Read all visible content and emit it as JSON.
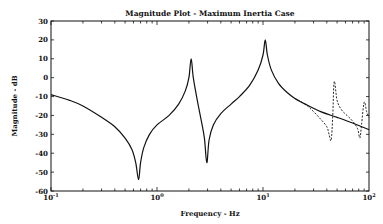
{
  "chart_data": {
    "type": "line",
    "title": "Magnitude Plot - Maximum Inertia Case",
    "xlabel": "Frequency - Hz",
    "ylabel": "Magnitude - dB",
    "xscale": "log",
    "xlim": [
      0.1,
      100
    ],
    "ylim": [
      -60,
      30
    ],
    "yticks": [
      30,
      20,
      10,
      0,
      -10,
      -20,
      -30,
      -40,
      -50,
      -60
    ],
    "xticks": [
      {
        "value": 0.1,
        "base": "10",
        "exp": "-1"
      },
      {
        "value": 1,
        "base": "10",
        "exp": "0"
      },
      {
        "value": 10,
        "base": "10",
        "exp": "1"
      },
      {
        "value": 100,
        "base": "10",
        "exp": "2"
      }
    ],
    "grid": false,
    "legend": null,
    "series": [
      {
        "name": "solid",
        "style": "solid",
        "points": [
          [
            0.1,
            -9
          ],
          [
            0.15,
            -12
          ],
          [
            0.2,
            -15
          ],
          [
            0.3,
            -21
          ],
          [
            0.4,
            -26
          ],
          [
            0.5,
            -32
          ],
          [
            0.58,
            -38
          ],
          [
            0.63,
            -45
          ],
          [
            0.67,
            -54
          ],
          [
            0.7,
            -45
          ],
          [
            0.75,
            -37
          ],
          [
            0.85,
            -30
          ],
          [
            1.0,
            -25
          ],
          [
            1.3,
            -20
          ],
          [
            1.6,
            -14
          ],
          [
            1.85,
            -7
          ],
          [
            2.0,
            0
          ],
          [
            2.1,
            10
          ],
          [
            2.2,
            0
          ],
          [
            2.4,
            -12
          ],
          [
            2.6,
            -22
          ],
          [
            2.8,
            -32
          ],
          [
            2.95,
            -45
          ],
          [
            3.1,
            -33
          ],
          [
            3.4,
            -25
          ],
          [
            4.0,
            -19
          ],
          [
            5.0,
            -14
          ],
          [
            6.0,
            -10
          ],
          [
            7.5,
            -4
          ],
          [
            9.0,
            4
          ],
          [
            10.0,
            12
          ],
          [
            10.5,
            20
          ],
          [
            11.0,
            12
          ],
          [
            12.0,
            4
          ],
          [
            14.0,
            -3
          ],
          [
            17.0,
            -8
          ],
          [
            20.0,
            -11
          ],
          [
            25.0,
            -14
          ],
          [
            35.0,
            -18
          ],
          [
            50.0,
            -21
          ],
          [
            70.0,
            -24
          ],
          [
            100.0,
            -27.5
          ]
        ]
      },
      {
        "name": "dashed",
        "style": "dashed",
        "points": [
          [
            20.0,
            -11
          ],
          [
            25.0,
            -14
          ],
          [
            30.0,
            -18
          ],
          [
            35.0,
            -22
          ],
          [
            40.0,
            -26
          ],
          [
            42.0,
            -30
          ],
          [
            44.0,
            -33
          ],
          [
            45.5,
            -20
          ],
          [
            47.0,
            -2
          ],
          [
            50.0,
            -12
          ],
          [
            55.0,
            -17
          ],
          [
            62.0,
            -20
          ],
          [
            70.0,
            -23
          ],
          [
            78.0,
            -27
          ],
          [
            82.0,
            -32
          ],
          [
            85.0,
            -25
          ],
          [
            90.0,
            -13
          ],
          [
            95.0,
            -18
          ],
          [
            100.0,
            -21
          ]
        ]
      }
    ]
  }
}
